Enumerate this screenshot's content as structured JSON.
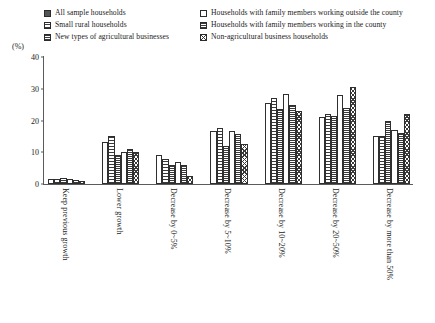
{
  "axis": {
    "unit_label": "(%)",
    "y_ticks": [
      "0",
      "10",
      "20",
      "30",
      "40"
    ]
  },
  "legend": {
    "items": [
      {
        "label": "All sample households",
        "pattern": "p-solid",
        "icon": "solid-square-swatch"
      },
      {
        "label": "Households with family members working outside the county",
        "pattern": "p-empty",
        "icon": "empty-square-swatch"
      },
      {
        "label": "Small rural households",
        "pattern": "p-vdash",
        "icon": "vertical-dashed-square-swatch"
      },
      {
        "label": "Households with family members working in the county",
        "pattern": "p-hline",
        "icon": "horizontal-line-square-swatch"
      },
      {
        "label": "New types of agricultural businesses",
        "pattern": "p-hdot",
        "icon": "horizontal-dotted-square-swatch"
      },
      {
        "label": "Non-agricultural business households",
        "pattern": "p-cross",
        "icon": "cross-hatch-square-swatch"
      }
    ]
  },
  "chart_data": {
    "type": "bar",
    "title": "",
    "xlabel": "",
    "ylabel": "(%)",
    "ylim": [
      0,
      40
    ],
    "grid": false,
    "legend_position": "top",
    "categories": [
      "Keep previous growth",
      "Lower growth",
      "Decrease by 0~5%",
      "Decrease by 5~10%",
      "Decrease by 10~20%",
      "Decrease by 20~50%",
      "Decrease by more than 50%"
    ],
    "series": [
      {
        "name": "All sample households",
        "pattern": "p-solid",
        "values": [
          1.5,
          13.2,
          9.0,
          16.8,
          25.5,
          21.0,
          15.0
        ]
      },
      {
        "name": "Small rural households",
        "pattern": "p-vdash",
        "values": [
          1.5,
          15.0,
          8.0,
          17.8,
          27.0,
          22.0,
          15.0
        ]
      },
      {
        "name": "New types of agricultural businesses",
        "pattern": "p-hdot",
        "values": [
          2.0,
          9.2,
          6.0,
          12.0,
          23.5,
          21.5,
          20.0
        ]
      },
      {
        "name": "Households with family members working outside the county",
        "pattern": "p-empty",
        "values": [
          1.5,
          10.2,
          7.0,
          16.8,
          28.5,
          28.0,
          17.0
        ]
      },
      {
        "name": "Households with family members working in the county",
        "pattern": "p-hline",
        "values": [
          1.2,
          11.0,
          6.0,
          15.8,
          25.0,
          24.0,
          16.0
        ]
      },
      {
        "name": "Non-agricultural business households",
        "pattern": "p-cross",
        "values": [
          1.0,
          10.0,
          2.5,
          12.5,
          23.0,
          30.5,
          22.0
        ]
      }
    ]
  }
}
